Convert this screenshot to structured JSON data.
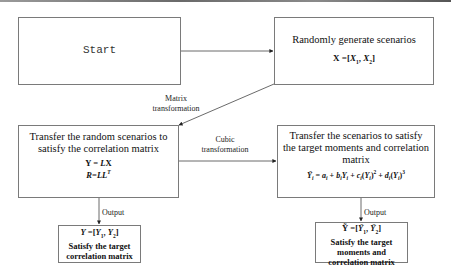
{
  "diagram": {
    "nodes": {
      "start": {
        "label": "Start"
      },
      "generate": {
        "title": "Randomly generate scenarios",
        "formula": "X = [X1, X2]"
      },
      "correlate": {
        "title_line1": "Transfer the random scenarios  to",
        "title_line2": "satisfy the correlation matrix",
        "formula_line1": "Y = LX",
        "formula_line2": "R=LL^T"
      },
      "moments": {
        "title_line1": "Transfer the scenarios to satisfy",
        "title_line2": "the target moments and correlation",
        "title_line3": "matrix",
        "formula": "Ỹi = ai + biYi + ci(Yi)^2 + di(Yi)^3"
      },
      "output_left": {
        "formula": "Y = [Y1, Y2]",
        "line1": "Satisfy the target",
        "line2": "correlation matrix"
      },
      "output_right": {
        "formula": "Ỹ = [Ỹ1, Ỹ2]",
        "line1": "Satisfy the target",
        "line2": "moments and",
        "line3": "correlation matrix"
      }
    },
    "edges": {
      "matrix_transformation": {
        "line1": "Matrix",
        "line2": "transformation"
      },
      "cubic_transformation": {
        "line1": "Cubic",
        "line2": "transformation"
      },
      "output_left": {
        "label": "Output"
      },
      "output_right": {
        "label": "Output"
      }
    }
  }
}
